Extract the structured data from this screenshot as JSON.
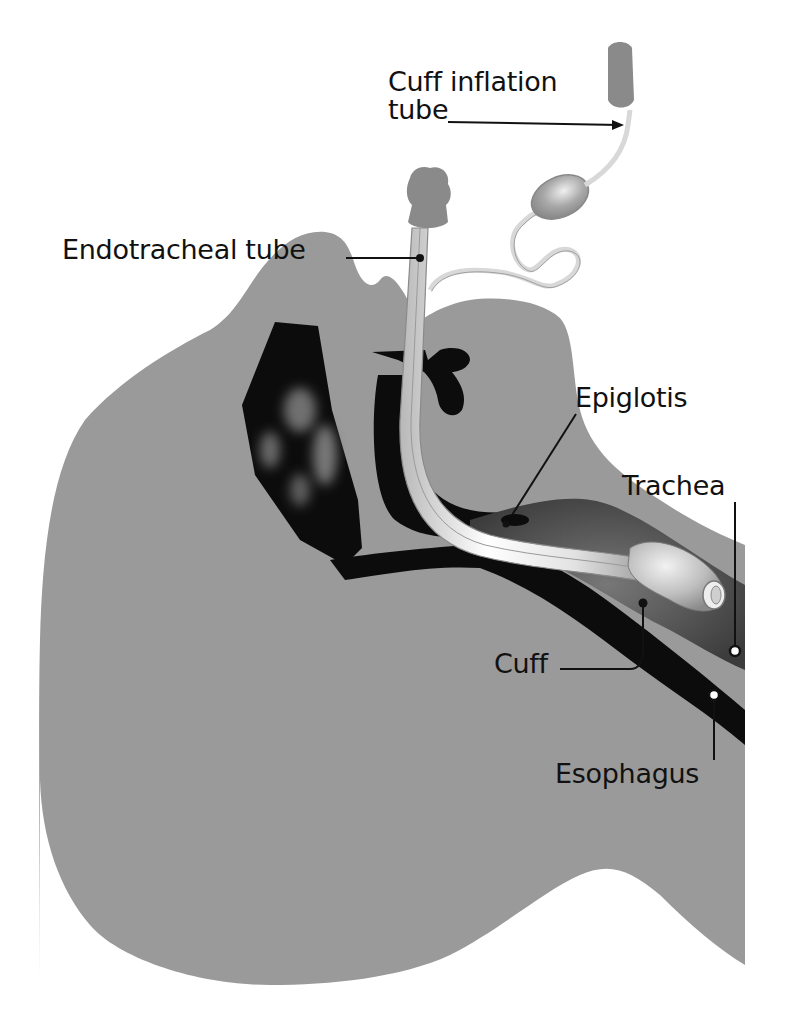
{
  "diagram": {
    "labels": {
      "cuff_inflation_tube_line1": "Cuff inflation",
      "cuff_inflation_tube_line2": "tube",
      "endotracheal_tube": "Endotracheal tube",
      "epiglotis": "Epiglotis",
      "trachea": "Trachea",
      "cuff": "Cuff",
      "esophagus": "Esophagus"
    },
    "colors": {
      "background": "#ffffff",
      "tissue": "#9a9a9a",
      "cavity": "#0c0c0c",
      "airway": "#555555",
      "tube": "#e8e8e8",
      "connector": "#8a8a8a",
      "label_text": "#111111"
    }
  }
}
